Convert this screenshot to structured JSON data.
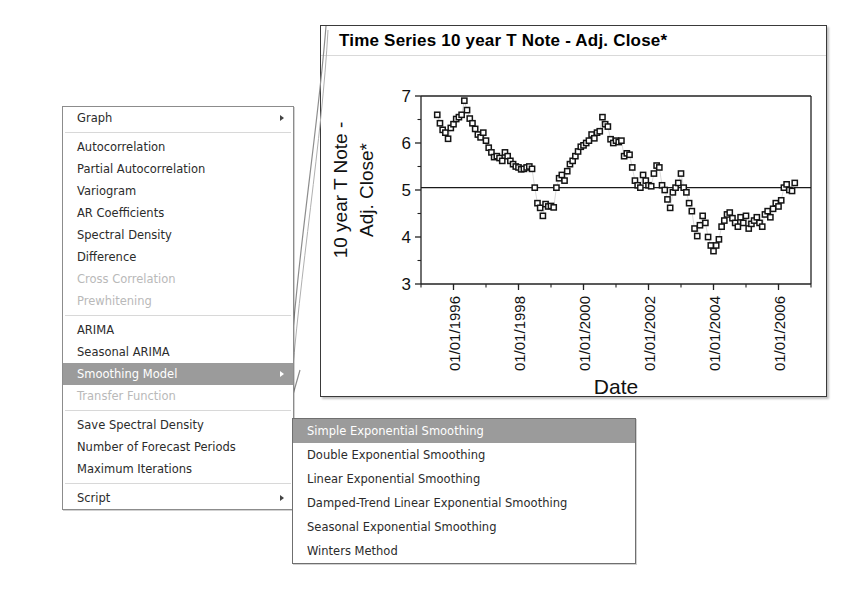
{
  "context_menu": {
    "groups": [
      {
        "items": [
          {
            "label": "Graph",
            "disabled": false,
            "selected": false,
            "has_submenu": true
          }
        ]
      },
      {
        "items": [
          {
            "label": "Autocorrelation",
            "disabled": false,
            "selected": false,
            "has_submenu": false
          },
          {
            "label": "Partial Autocorrelation",
            "disabled": false,
            "selected": false,
            "has_submenu": false
          },
          {
            "label": "Variogram",
            "disabled": false,
            "selected": false,
            "has_submenu": false
          },
          {
            "label": "AR Coefficients",
            "disabled": false,
            "selected": false,
            "has_submenu": false
          },
          {
            "label": "Spectral Density",
            "disabled": false,
            "selected": false,
            "has_submenu": false
          },
          {
            "label": "Difference",
            "disabled": false,
            "selected": false,
            "has_submenu": false
          },
          {
            "label": "Cross Correlation",
            "disabled": true,
            "selected": false,
            "has_submenu": false
          },
          {
            "label": "Prewhitening",
            "disabled": true,
            "selected": false,
            "has_submenu": false
          }
        ]
      },
      {
        "items": [
          {
            "label": "ARIMA",
            "disabled": false,
            "selected": false,
            "has_submenu": false
          },
          {
            "label": "Seasonal ARIMA",
            "disabled": false,
            "selected": false,
            "has_submenu": false
          },
          {
            "label": "Smoothing Model",
            "disabled": false,
            "selected": true,
            "has_submenu": true
          },
          {
            "label": "Transfer Function",
            "disabled": true,
            "selected": false,
            "has_submenu": false
          }
        ]
      },
      {
        "items": [
          {
            "label": "Save Spectral Density",
            "disabled": false,
            "selected": false,
            "has_submenu": false
          },
          {
            "label": "Number of Forecast Periods",
            "disabled": false,
            "selected": false,
            "has_submenu": false
          },
          {
            "label": "Maximum Iterations",
            "disabled": false,
            "selected": false,
            "has_submenu": false
          }
        ]
      },
      {
        "items": [
          {
            "label": "Script",
            "disabled": false,
            "selected": false,
            "has_submenu": true
          }
        ]
      }
    ],
    "highlight_color": "#9b9b9b",
    "disabled_color": "#b9b9b9"
  },
  "submenu": {
    "title": "Smoothing Model",
    "items": [
      {
        "label": "Simple Exponential Smoothing",
        "selected": true
      },
      {
        "label": "Double Exponential Smoothing",
        "selected": false
      },
      {
        "label": "Linear Exponential Smoothing",
        "selected": false
      },
      {
        "label": "Damped-Trend Linear Exponential Smoothing",
        "selected": false
      },
      {
        "label": "Seasonal Exponential Smoothing",
        "selected": false
      },
      {
        "label": "Winters Method",
        "selected": false
      }
    ]
  },
  "chart_window": {
    "title": "Time Series 10 year T Note - Adj. Close*"
  },
  "chart_data": {
    "type": "scatter",
    "title": "Time Series 10 year T Note - Adj. Close*",
    "xlabel": "Date",
    "ylabel": "10 year T Note - Adj. Close*",
    "ylim": [
      3,
      7
    ],
    "yticks": [
      3,
      4,
      5,
      6,
      7
    ],
    "xlim": [
      "01/01/1995",
      "01/01/2007"
    ],
    "xticks": [
      "01/01/1996",
      "01/01/1998",
      "01/01/2000",
      "01/01/2002",
      "01/01/2004",
      "01/01/2006"
    ],
    "grid": false,
    "marker": "open-square",
    "marker_color": "#111111",
    "reference_line": {
      "y": 5.05,
      "color": "#1a1a1a"
    },
    "series": [
      {
        "name": "10 year T Note - Adj. Close*",
        "x": [
          "1995-07",
          "1995-08",
          "1995-09",
          "1995-10",
          "1995-11",
          "1995-12",
          "1996-01",
          "1996-02",
          "1996-03",
          "1996-04",
          "1996-05",
          "1996-06",
          "1996-07",
          "1996-08",
          "1996-09",
          "1996-10",
          "1996-11",
          "1996-12",
          "1997-01",
          "1997-02",
          "1997-03",
          "1997-04",
          "1997-05",
          "1997-06",
          "1997-07",
          "1997-08",
          "1997-09",
          "1997-10",
          "1997-11",
          "1997-12",
          "1998-01",
          "1998-02",
          "1998-03",
          "1998-04",
          "1998-05",
          "1998-06",
          "1998-07",
          "1998-08",
          "1998-09",
          "1998-10",
          "1998-11",
          "1998-12",
          "1999-01",
          "1999-02",
          "1999-03",
          "1999-04",
          "1999-05",
          "1999-06",
          "1999-07",
          "1999-08",
          "1999-09",
          "1999-10",
          "1999-11",
          "1999-12",
          "2000-01",
          "2000-02",
          "2000-03",
          "2000-04",
          "2000-05",
          "2000-06",
          "2000-07",
          "2000-08",
          "2000-09",
          "2000-10",
          "2000-11",
          "2000-12",
          "2001-01",
          "2001-02",
          "2001-03",
          "2001-04",
          "2001-05",
          "2001-06",
          "2001-07",
          "2001-08",
          "2001-09",
          "2001-10",
          "2001-11",
          "2001-12",
          "2002-01",
          "2002-02",
          "2002-03",
          "2002-04",
          "2002-05",
          "2002-06",
          "2002-07",
          "2002-08",
          "2002-09",
          "2002-10",
          "2002-11",
          "2002-12",
          "2003-01",
          "2003-02",
          "2003-03",
          "2003-04",
          "2003-05",
          "2003-06",
          "2003-07",
          "2003-08",
          "2003-09",
          "2003-10",
          "2003-11",
          "2003-12",
          "2004-01",
          "2004-02",
          "2004-03",
          "2004-04",
          "2004-05",
          "2004-06",
          "2004-07",
          "2004-08",
          "2004-09",
          "2004-10",
          "2004-11",
          "2004-12",
          "2005-01",
          "2005-02",
          "2005-03",
          "2005-04",
          "2005-05",
          "2005-06",
          "2005-07",
          "2005-08",
          "2005-09",
          "2005-10",
          "2005-11",
          "2005-12",
          "2006-01",
          "2006-02",
          "2006-03",
          "2006-04",
          "2006-05",
          "2006-06",
          "2006-07"
        ],
        "y": [
          6.6,
          6.42,
          6.28,
          6.22,
          6.09,
          6.32,
          6.4,
          6.51,
          6.55,
          6.6,
          6.9,
          6.7,
          6.52,
          6.42,
          6.3,
          6.18,
          6.12,
          6.22,
          6.05,
          5.9,
          5.8,
          5.7,
          5.72,
          5.68,
          5.62,
          5.8,
          5.72,
          5.62,
          5.55,
          5.5,
          5.48,
          5.44,
          5.45,
          5.48,
          5.5,
          5.45,
          5.05,
          4.72,
          4.62,
          4.45,
          4.7,
          4.65,
          4.66,
          4.63,
          5.05,
          5.25,
          5.32,
          5.2,
          5.4,
          5.55,
          5.62,
          5.72,
          5.82,
          5.92,
          5.95,
          6.0,
          6.05,
          6.18,
          6.1,
          6.22,
          6.25,
          6.55,
          6.4,
          6.35,
          6.08,
          6.0,
          6.05,
          6.02,
          6.05,
          5.72,
          5.78,
          5.75,
          5.48,
          5.2,
          5.1,
          5.05,
          5.32,
          5.2,
          5.1,
          5.08,
          5.35,
          5.52,
          5.48,
          5.1,
          5.0,
          4.8,
          4.62,
          4.95,
          5.05,
          5.15,
          5.35,
          5.05,
          4.95,
          4.72,
          4.55,
          4.18,
          4.02,
          4.25,
          4.45,
          4.3,
          4.0,
          3.82,
          3.7,
          3.82,
          3.95,
          4.22,
          4.35,
          4.48,
          4.52,
          4.4,
          4.3,
          4.22,
          4.42,
          4.3,
          4.45,
          4.18,
          4.28,
          4.35,
          4.42,
          4.3,
          4.22,
          4.48,
          4.55,
          4.42,
          4.6,
          4.72,
          4.65,
          4.78,
          5.05,
          5.12,
          5.0,
          4.98,
          5.15
        ]
      }
    ]
  }
}
